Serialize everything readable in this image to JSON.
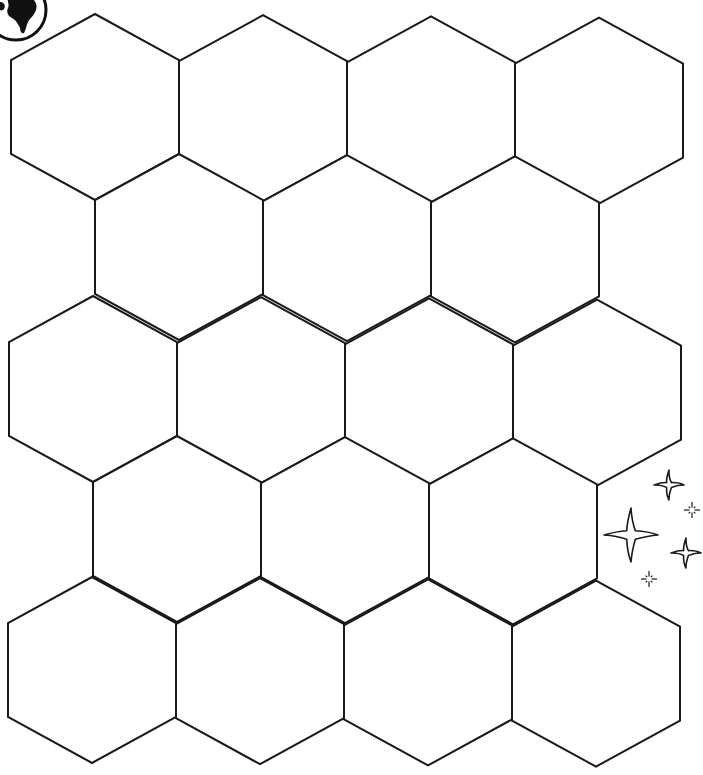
{
  "page": {
    "width": 703,
    "height": 775,
    "background": "#ffffff",
    "line_color": "#1a1a1a"
  },
  "grid": {
    "type": "pointy-top hexagon tessellation",
    "rows": 5,
    "columns_per_row": [
      4,
      3,
      4,
      3,
      4
    ],
    "cell_count": 18,
    "hex_width": 168,
    "hex_side_vertical": 94,
    "cells": []
  },
  "decorations": {
    "globe_icon": {
      "name": "globe-icon",
      "position": "top-left corner, partially cropped"
    },
    "sparkles": [
      {
        "name": "sparkle-large-icon",
        "cx": 631,
        "cy": 535,
        "size": "large"
      },
      {
        "name": "sparkle-medium-icon",
        "cx": 669,
        "cy": 485,
        "size": "medium"
      },
      {
        "name": "sparkle-medium-icon",
        "cx": 686,
        "cy": 553,
        "size": "medium"
      },
      {
        "name": "sparkle-tiny-icon",
        "cx": 692,
        "cy": 510,
        "size": "tiny"
      },
      {
        "name": "sparkle-tiny-icon",
        "cx": 649,
        "cy": 579,
        "size": "tiny"
      }
    ]
  }
}
